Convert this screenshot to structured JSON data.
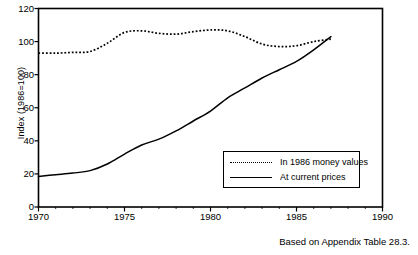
{
  "chart_data": {
    "type": "line",
    "title": "",
    "xlabel": "",
    "ylabel": "Index (1986=100)",
    "xlim": [
      1970,
      1990
    ],
    "ylim": [
      0,
      120
    ],
    "grid": false,
    "legend_position": "lower-right-inside",
    "x_ticks": [
      1970,
      1975,
      1980,
      1985,
      1990
    ],
    "x_tick_labels": [
      "1970",
      "1975",
      "1980",
      "1985",
      "1990"
    ],
    "x_minor_ticks": [
      1971,
      1972,
      1973,
      1974,
      1976,
      1977,
      1978,
      1979,
      1981,
      1982,
      1983,
      1984,
      1986,
      1987,
      1988,
      1989
    ],
    "y_ticks": [
      0,
      20,
      40,
      60,
      80,
      100,
      120
    ],
    "y_tick_labels": [
      "0",
      "20",
      "40",
      "60",
      "80",
      "100",
      "120"
    ],
    "x": [
      1970,
      1971,
      1972,
      1973,
      1974,
      1975,
      1976,
      1977,
      1978,
      1979,
      1980,
      1981,
      1982,
      1983,
      1984,
      1985,
      1986,
      1987
    ],
    "series": [
      {
        "name": "In 1986 money values",
        "style": "dotted",
        "values": [
          93,
          93,
          93.5,
          94,
          99,
          105.5,
          106.5,
          105,
          104.5,
          106,
          107,
          106.5,
          103,
          98.5,
          97,
          97.5,
          100,
          101.5
        ]
      },
      {
        "name": "At current prices",
        "style": "solid",
        "values": [
          18.5,
          19.5,
          20.5,
          22,
          26,
          32,
          37.5,
          41,
          46,
          52,
          58,
          66,
          72,
          78,
          83,
          88,
          95,
          103
        ]
      }
    ],
    "annotations": [
      "Based on Appendix Table 28.3."
    ]
  },
  "legend": {
    "items": [
      {
        "label": "In 1986 money values",
        "style": "dotted"
      },
      {
        "label": "At current prices",
        "style": "solid"
      }
    ]
  },
  "caption": {
    "text": "Based on Appendix Table 28.3."
  },
  "colors": {
    "line": "#000000",
    "axis": "#000000",
    "background": "#ffffff"
  }
}
